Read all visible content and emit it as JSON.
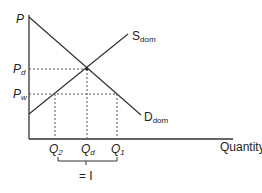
{
  "diagram": {
    "type": "supply-demand",
    "axes": {
      "y_label": "P",
      "x_label": "Quantity"
    },
    "curves": {
      "supply": {
        "label": "S",
        "subscript": "dom"
      },
      "demand": {
        "label": "D",
        "subscript": "dom"
      }
    },
    "price_levels": [
      {
        "label": "P",
        "subscript": "d"
      },
      {
        "label": "P",
        "subscript": "w"
      }
    ],
    "quantity_levels": [
      {
        "label": "Q",
        "subscript": "2"
      },
      {
        "label": "Q",
        "subscript": "d"
      },
      {
        "label": "Q",
        "subscript": "1"
      }
    ],
    "bracket_label": "= I",
    "colors": {
      "line": "#333333",
      "dashed": "#555555",
      "background": "#ffffff"
    }
  }
}
